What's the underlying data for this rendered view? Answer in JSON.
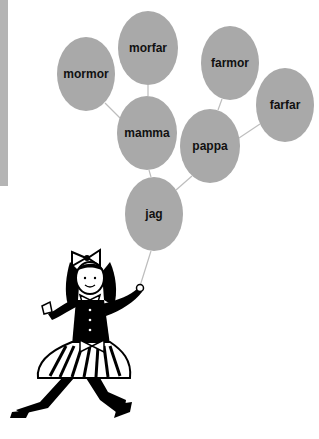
{
  "diagram": {
    "type": "family-tree-balloons",
    "colors": {
      "balloon_fill": "#a9a9a9",
      "string": "#bdbdbd",
      "text": "#111111",
      "side_bar": "#b4b4b4"
    },
    "balloons": [
      {
        "id": "mormor",
        "label": "mormor",
        "cx": 86,
        "cy": 74,
        "rx": 29,
        "ry": 37
      },
      {
        "id": "morfar",
        "label": "morfar",
        "cx": 148,
        "cy": 48,
        "rx": 30,
        "ry": 37
      },
      {
        "id": "farmor",
        "label": "farmor",
        "cx": 230,
        "cy": 63,
        "rx": 29,
        "ry": 37
      },
      {
        "id": "farfar",
        "label": "farfar",
        "cx": 285,
        "cy": 105,
        "rx": 29,
        "ry": 37
      },
      {
        "id": "mamma",
        "label": "mamma",
        "cx": 147,
        "cy": 133,
        "rx": 30,
        "ry": 37
      },
      {
        "id": "pappa",
        "label": "pappa",
        "cx": 210,
        "cy": 146,
        "rx": 30,
        "ry": 37
      },
      {
        "id": "jag",
        "label": "jag",
        "cx": 154,
        "cy": 214,
        "rx": 29,
        "ry": 37
      }
    ],
    "connections": [
      {
        "from": "mormor",
        "to": "mamma"
      },
      {
        "from": "morfar",
        "to": "mamma"
      },
      {
        "from": "farmor",
        "to": "pappa"
      },
      {
        "from": "farfar",
        "to": "pappa"
      },
      {
        "from": "mamma",
        "to": "jag"
      },
      {
        "from": "pappa",
        "to": "jag"
      }
    ],
    "figure": "girl-holding-balloon-string"
  }
}
